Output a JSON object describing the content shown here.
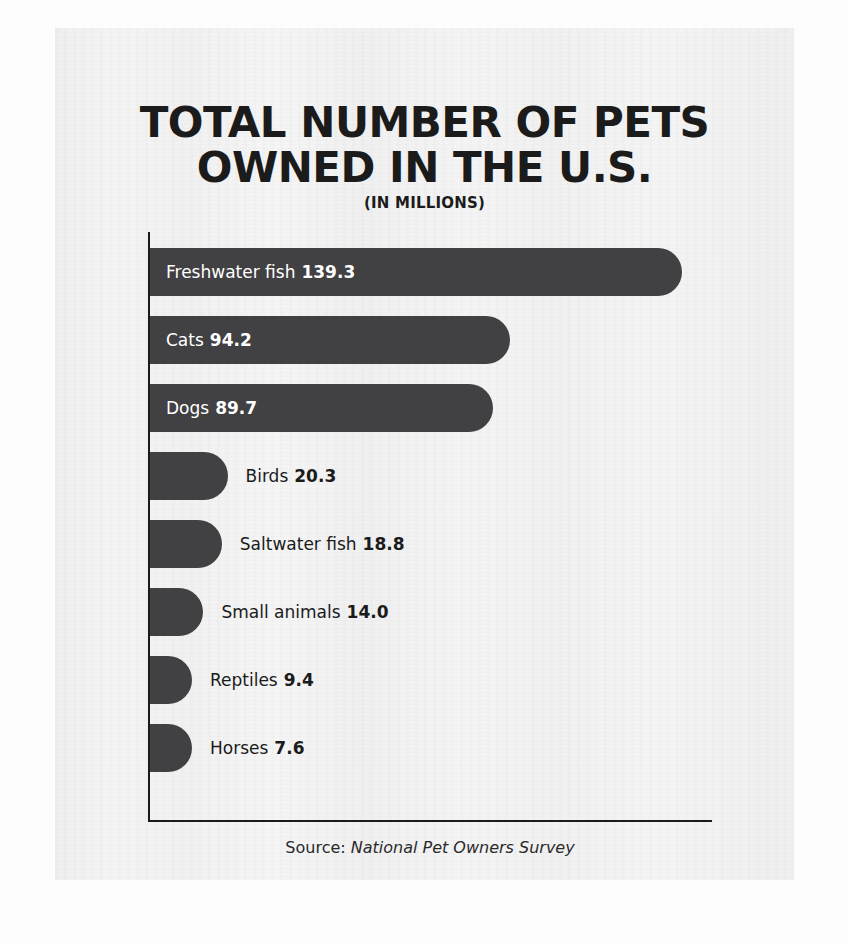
{
  "poster": {
    "title_line1": "TOTAL NUMBER OF PETS",
    "title_line2": "OWNED IN THE U.S.",
    "subtitle": "(IN MILLIONS)",
    "source_prefix": "Source:",
    "source_name": "National Pet Owners Survey"
  },
  "colors": {
    "bar": "#414042",
    "axis": "#1b1b1b",
    "label_inside": "#ffffff",
    "label_outside": "#1b1b1b",
    "card_background": "#f2f2f2",
    "page_background": "#fdfdfd"
  },
  "chart_data": {
    "type": "bar",
    "orientation": "horizontal",
    "title": "TOTAL NUMBER OF PETS OWNED IN THE U.S.",
    "subtitle": "(IN MILLIONS)",
    "units": "millions",
    "xlabel": "",
    "ylabel": "",
    "grid": false,
    "legend": false,
    "xlim": [
      0,
      147
    ],
    "source": "National Pet Owners Survey",
    "categories": [
      "Freshwater fish",
      "Cats",
      "Dogs",
      "Birds",
      "Saltwater fish",
      "Small animals",
      "Reptiles",
      "Horses"
    ],
    "values": [
      139.3,
      94.2,
      89.7,
      20.3,
      18.8,
      14.0,
      9.4,
      7.6
    ],
    "value_labels": [
      "139.3",
      "94.2",
      "89.7",
      "20.3",
      "18.8",
      "14.0",
      "9.4",
      "7.6"
    ],
    "label_placement": [
      "inside",
      "inside",
      "inside",
      "outside",
      "outside",
      "outside",
      "outside",
      "outside"
    ]
  }
}
